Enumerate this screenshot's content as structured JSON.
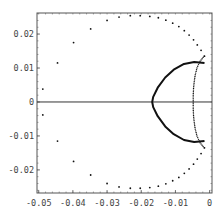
{
  "chart_data": {
    "type": "scatter",
    "title": "",
    "xlabel": "",
    "ylabel": "",
    "xlim": [
      -0.0505,
      0.0007
    ],
    "ylim": [
      -0.0268,
      0.0262
    ],
    "grid": false,
    "legend": null,
    "x_ticks": [
      -0.05,
      -0.04,
      -0.03,
      -0.02,
      -0.01,
      0
    ],
    "x_tick_labels": [
      "-0.05",
      "-0.04",
      "-0.03",
      "-0.02",
      "-0.01",
      "0"
    ],
    "y_ticks": [
      0.02,
      0.01,
      0,
      -0.01,
      -0.02
    ],
    "y_tick_labels": [
      "0.02",
      "0.01",
      "0",
      "-0.01",
      "-0.02"
    ],
    "reference_lines": [
      {
        "orientation": "horizontal",
        "y": 0
      }
    ],
    "series": [
      {
        "name": "outer sparse dotted arc",
        "style": "sparse-dots",
        "points": [
          [
            -0.0015,
            0.0135
          ],
          [
            -0.0025,
            0.0152
          ],
          [
            -0.0036,
            0.0168
          ],
          [
            -0.0047,
            0.0183
          ],
          [
            -0.006,
            0.0197
          ],
          [
            -0.0074,
            0.021
          ],
          [
            -0.009,
            0.0222
          ],
          [
            -0.0108,
            0.0232
          ],
          [
            -0.0128,
            0.0241
          ],
          [
            -0.015,
            0.0248
          ],
          [
            -0.0175,
            0.0252
          ],
          [
            -0.0203,
            0.0254
          ],
          [
            -0.0232,
            0.0254
          ],
          [
            -0.0265,
            0.025
          ],
          [
            -0.03,
            0.024
          ],
          [
            -0.0348,
            0.0215
          ],
          [
            -0.0398,
            0.0175
          ],
          [
            -0.0445,
            0.0115
          ],
          [
            -0.0488,
            0.0038
          ],
          [
            -0.0488,
            -0.0038
          ],
          [
            -0.0445,
            -0.0115
          ],
          [
            -0.0398,
            -0.0175
          ],
          [
            -0.0348,
            -0.0215
          ],
          [
            -0.03,
            -0.024
          ],
          [
            -0.0265,
            -0.025
          ],
          [
            -0.0232,
            -0.0254
          ],
          [
            -0.0203,
            -0.0254
          ],
          [
            -0.0175,
            -0.0252
          ],
          [
            -0.015,
            -0.0248
          ],
          [
            -0.0128,
            -0.0241
          ],
          [
            -0.0108,
            -0.0232
          ],
          [
            -0.009,
            -0.0222
          ],
          [
            -0.0074,
            -0.021
          ],
          [
            -0.006,
            -0.0197
          ],
          [
            -0.0047,
            -0.0183
          ],
          [
            -0.0036,
            -0.0168
          ],
          [
            -0.0025,
            -0.0152
          ],
          [
            -0.0015,
            -0.0135
          ]
        ]
      },
      {
        "name": "inner dense dotted curve",
        "style": "dense-dots",
        "points": [
          [
            -0.0016,
            0.0135
          ],
          [
            -0.0028,
            0.012
          ],
          [
            -0.0037,
            0.01
          ],
          [
            -0.0042,
            0.008
          ],
          [
            -0.0045,
            0.006
          ],
          [
            -0.0047,
            0.004
          ],
          [
            -0.0048,
            0.002
          ],
          [
            -0.0048,
            0
          ],
          [
            -0.0048,
            -0.002
          ],
          [
            -0.0047,
            -0.004
          ],
          [
            -0.0045,
            -0.006
          ],
          [
            -0.0042,
            -0.008
          ],
          [
            -0.0037,
            -0.01
          ],
          [
            -0.0028,
            -0.012
          ],
          [
            -0.0016,
            -0.0135
          ]
        ]
      },
      {
        "name": "solid arc",
        "style": "solid",
        "points": [
          [
            -0.0015,
            0.0115
          ],
          [
            -0.0045,
            0.0118
          ],
          [
            -0.0075,
            0.0112
          ],
          [
            -0.0105,
            0.0095
          ],
          [
            -0.013,
            0.0072
          ],
          [
            -0.0152,
            0.0042
          ],
          [
            -0.0165,
            0.0015
          ],
          [
            -0.0168,
            0
          ],
          [
            -0.0165,
            -0.0015
          ],
          [
            -0.0152,
            -0.0042
          ],
          [
            -0.013,
            -0.0072
          ],
          [
            -0.0105,
            -0.0095
          ],
          [
            -0.0075,
            -0.0112
          ],
          [
            -0.0045,
            -0.0118
          ],
          [
            -0.0015,
            -0.0115
          ]
        ]
      }
    ]
  },
  "colors": {
    "frame": "#555555",
    "data": "#111111",
    "tick_text": "#444444",
    "background": "#ffffff"
  }
}
